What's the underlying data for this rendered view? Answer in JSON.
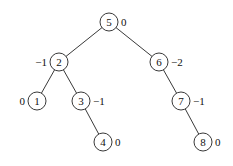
{
  "diagram": {
    "type": "binary-tree",
    "nodes": [
      {
        "id": "n5",
        "key": "5",
        "balance": "0",
        "x": 109,
        "y": 22,
        "bx": 121,
        "bside": "right"
      },
      {
        "id": "n2",
        "key": "2",
        "balance": "−1",
        "x": 59,
        "y": 62,
        "bx": 47,
        "bside": "left"
      },
      {
        "id": "n6",
        "key": "6",
        "balance": "−2",
        "x": 159,
        "y": 62,
        "bx": 171,
        "bside": "right"
      },
      {
        "id": "n1",
        "key": "1",
        "balance": "0",
        "x": 37,
        "y": 101,
        "bx": 25,
        "bside": "left"
      },
      {
        "id": "n3",
        "key": "3",
        "balance": "−1",
        "x": 81,
        "y": 101,
        "bx": 93,
        "bside": "right"
      },
      {
        "id": "n7",
        "key": "7",
        "balance": "−1",
        "x": 181,
        "y": 101,
        "bx": 193,
        "bside": "right"
      },
      {
        "id": "n4",
        "key": "4",
        "balance": "0",
        "x": 103,
        "y": 142,
        "bx": 115,
        "bside": "right"
      },
      {
        "id": "n8",
        "key": "8",
        "balance": "0",
        "x": 203,
        "y": 142,
        "bx": 215,
        "bside": "right"
      }
    ],
    "edges": [
      [
        "n5",
        "n2"
      ],
      [
        "n5",
        "n6"
      ],
      [
        "n2",
        "n1"
      ],
      [
        "n2",
        "n3"
      ],
      [
        "n3",
        "n4"
      ],
      [
        "n6",
        "n7"
      ],
      [
        "n7",
        "n8"
      ]
    ],
    "radius": 9
  }
}
